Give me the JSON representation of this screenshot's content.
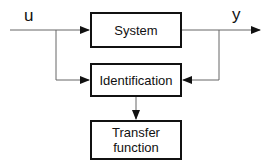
{
  "diagram": {
    "input_label": "u",
    "output_label": "y",
    "blocks": [
      {
        "id": "system",
        "label": "System"
      },
      {
        "id": "identification",
        "label": "Identification"
      },
      {
        "id": "transfer",
        "label": "Transfer function"
      }
    ],
    "colors": {
      "line": "#111111",
      "wire": "#777777",
      "background": "#ffffff"
    }
  }
}
